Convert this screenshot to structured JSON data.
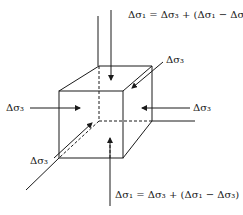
{
  "diagram": {
    "title": "",
    "labels": {
      "top_equation": "Δσ₁ = Δσ₃ + (Δσ₁ − Δσ₃)",
      "bottom_equation": "Δσ₁ = Δσ₃ + (Δσ₁ − Δσ₃)",
      "back_right": "Δσ₃",
      "right": "Δσ₃",
      "left": "Δσ₃",
      "front_left": "Δσ₃"
    },
    "colors": {
      "line": "#1a1a1a",
      "background": "#ffffff"
    }
  }
}
